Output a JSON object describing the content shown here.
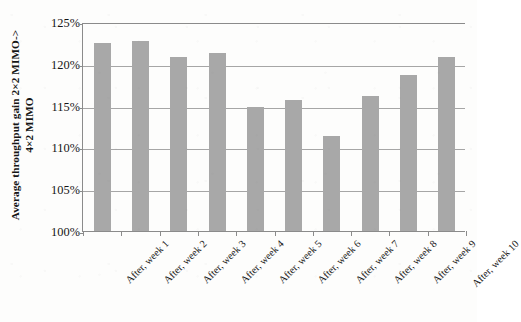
{
  "chart_data": {
    "type": "bar",
    "title": "",
    "subtitle": "",
    "xlabel": "",
    "ylabel": "Average throughput gain 2×2 MIMO-> 4×2 MIMO",
    "ylabel_line1": "Average throughput gain 2×2 MIMO->",
    "ylabel_line2": "4×2 MIMO",
    "categories": [
      "After, week 1",
      "After, week 2",
      "After, week 3",
      "After, week 4",
      "After, week 5",
      "After, week 6",
      "After, week 7",
      "After, week 8",
      "After, week 9",
      "After, week 10"
    ],
    "values": [
      122.5,
      122.7,
      120.8,
      121.3,
      114.8,
      115.7,
      111.4,
      116.2,
      118.7,
      120.8
    ],
    "value_unit": "%",
    "ylim": [
      100,
      125
    ],
    "ytick_values": [
      100,
      105,
      110,
      115,
      120,
      125
    ],
    "ytick_labels": [
      "100%",
      "105%",
      "110%",
      "115%",
      "120%",
      "125%"
    ],
    "grid": true,
    "grid_axis": "y",
    "legend": false,
    "legend_position": "none",
    "bar_color": "#a8a8a8",
    "axis_color": "#8b8b8b",
    "gridline_color": "#a6a6a6",
    "background_color": "#fdfdfc",
    "text_color": "#161616"
  }
}
